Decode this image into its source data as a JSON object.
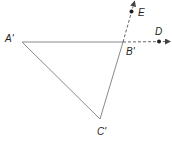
{
  "diagram": {
    "type": "geometry-figure",
    "colors": {
      "line": "#8a8a8a",
      "dashed": "#555555",
      "point": "#231f20",
      "text": "#231f20"
    },
    "triangle": {
      "vertices": [
        {
          "name": "A'",
          "x": 22,
          "y": 42
        },
        {
          "name": "B'",
          "x": 123,
          "y": 42
        },
        {
          "name": "C'",
          "x": 100,
          "y": 119
        }
      ]
    },
    "rays": [
      {
        "from": "B'",
        "through": "D",
        "style": "dashed",
        "arrow": true
      },
      {
        "from": "B'",
        "through": "E",
        "style": "dashed",
        "arrow": true
      }
    ],
    "points": [
      {
        "name": "D",
        "x": 159,
        "y": 41
      },
      {
        "name": "E",
        "x": 131,
        "y": 11
      }
    ],
    "labels": {
      "a_prime": "A'",
      "b_prime": "B'",
      "c_prime": "C'",
      "d": "D",
      "e": "E"
    }
  }
}
